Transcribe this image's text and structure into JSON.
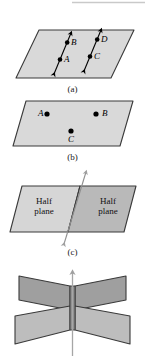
{
  "figure": {
    "top_rule": {
      "present": true,
      "color": "#c9c9c9"
    },
    "colors": {
      "plane_light": "#d9d9d9",
      "plane_mid": "#cfcfcf",
      "plane_dark": "#b4b4b4",
      "plane_darker": "#a8a8a8",
      "outline": "#3a3a3a",
      "point": "#000000",
      "arrow_line": "#000000",
      "arrow_gray": "#a6a6a6",
      "background": "#ffffff"
    },
    "panels": [
      {
        "id": "a",
        "caption": "(a)",
        "description": "slanted plane with two parallel double-headed lines, each carrying two labeled points",
        "lines": [
          {
            "name": "line-left",
            "points": [
              "A",
              "B"
            ]
          },
          {
            "name": "line-right",
            "points": [
              "C",
              "D"
            ]
          }
        ],
        "point_labels": [
          {
            "text": "B",
            "x": 71,
            "y": 43
          },
          {
            "text": "D",
            "x": 101,
            "y": 40
          },
          {
            "text": "A",
            "x": 64,
            "y": 61
          },
          {
            "text": "C",
            "x": 94,
            "y": 58
          }
        ]
      },
      {
        "id": "b",
        "caption": "(b)",
        "description": "flat plane containing three labeled points",
        "point_labels": [
          {
            "text": "A",
            "x": 38,
            "y": 113
          },
          {
            "text": "B",
            "x": 102,
            "y": 113
          },
          {
            "text": "C",
            "x": 68,
            "y": 139
          }
        ]
      },
      {
        "id": "c",
        "caption": "(c)",
        "description": "plane divided by a line into two half planes",
        "half_plane_labels": [
          {
            "line1": "Half",
            "line2": "plane",
            "x": 26,
            "y": 196
          },
          {
            "line1": "Half",
            "line2": "plane",
            "x": 89,
            "y": 196
          }
        ]
      },
      {
        "id": "d",
        "caption": "",
        "description": "two intersecting planes forming an X with a vertical line of intersection"
      }
    ]
  }
}
